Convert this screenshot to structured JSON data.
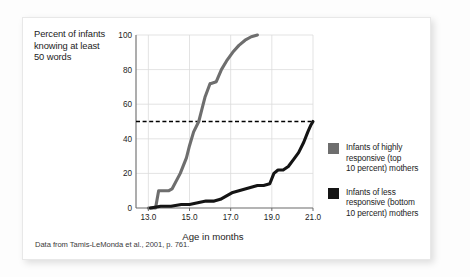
{
  "card": {
    "citation": "Data from Tamis-LeMonda et al., 2001, p. 761."
  },
  "chart_data": {
    "type": "line",
    "title": "",
    "ylabel": "Percent of infants knowing at least 50 words",
    "xlabel": "Age in months",
    "xlim": [
      12.4,
      21.0
    ],
    "ylim": [
      0,
      100
    ],
    "xticks": [
      13.0,
      15.0,
      17.0,
      19.0,
      21.0
    ],
    "xtick_labels": [
      "13.0",
      "15.0",
      "17.0",
      "19.0",
      "21.0"
    ],
    "yticks": [
      0,
      20,
      40,
      60,
      80,
      100
    ],
    "ytick_labels": [
      "0",
      "20",
      "40",
      "60",
      "80",
      "100"
    ],
    "grid": true,
    "legend_position": "right",
    "reference_line": {
      "axis": "y",
      "value": 50,
      "style": "dashed",
      "color": "#000000"
    },
    "series": [
      {
        "name": "Infants of highly responsive (top 10 percent) mothers",
        "color": "#6e6e6e",
        "x": [
          13.0,
          13.35,
          13.5,
          14.0,
          14.15,
          14.55,
          14.85,
          15.0,
          15.2,
          15.45,
          15.6,
          15.75,
          16.0,
          16.05,
          16.3,
          16.55,
          16.8,
          17.1,
          17.4,
          17.7,
          18.0,
          18.3
        ],
        "values": [
          0,
          0,
          10,
          10,
          11,
          20,
          29,
          36,
          44,
          50,
          57,
          64,
          72,
          72,
          73,
          80,
          85,
          90,
          94,
          97,
          99,
          100
        ]
      },
      {
        "name": "Infants of less responsive (bottom 10 percent) mothers",
        "color": "#141414",
        "x": [
          13.1,
          13.6,
          14.1,
          14.6,
          15.0,
          15.4,
          15.8,
          16.0,
          16.2,
          16.5,
          16.8,
          17.1,
          17.4,
          17.7,
          18.0,
          18.3,
          18.6,
          18.9,
          19.1,
          19.3,
          19.55,
          19.8,
          20.05,
          20.3,
          20.55,
          20.75,
          20.9,
          21.0
        ],
        "values": [
          0,
          1,
          1,
          2,
          2,
          3,
          4,
          4,
          4,
          5,
          7,
          9,
          10,
          11,
          12,
          13,
          13,
          14,
          20,
          22,
          22,
          24,
          28,
          32,
          38,
          44,
          48,
          50
        ]
      }
    ]
  },
  "legend": {
    "items": [
      {
        "swatch_color": "#6e6e6e",
        "lines": [
          "Infants of highly",
          "responsive (top",
          "10 percent) mothers"
        ]
      },
      {
        "swatch_color": "#141414",
        "lines": [
          "Infants of less",
          "responsive (bottom",
          "10 percent) mothers"
        ]
      }
    ]
  }
}
